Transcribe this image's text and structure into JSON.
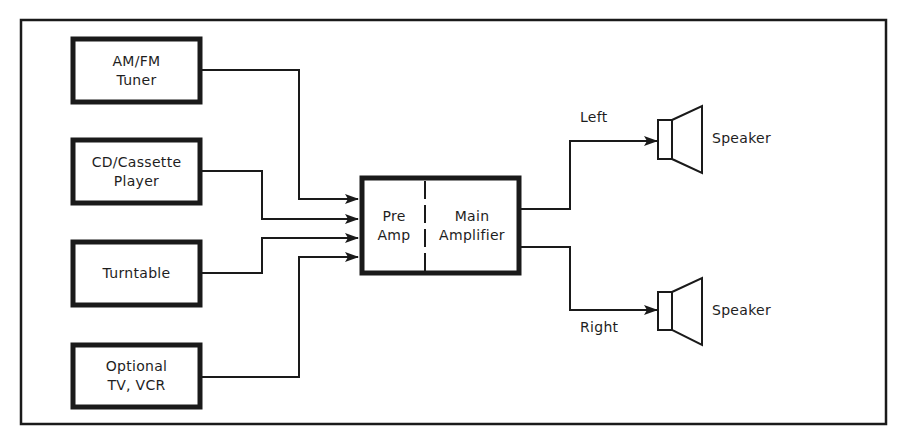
{
  "diagram": {
    "sources": [
      {
        "id": "am-fm-tuner",
        "line1": "AM/FM",
        "line2": "Tuner"
      },
      {
        "id": "cd-cassette-player",
        "line1": "CD/Cassette",
        "line2": "Player"
      },
      {
        "id": "turntable",
        "line1": "Turntable",
        "line2": ""
      },
      {
        "id": "optional-tv-vcr",
        "line1": "Optional",
        "line2": "TV, VCR"
      }
    ],
    "amplifier": {
      "pre_line1": "Pre",
      "pre_line2": "Amp",
      "main_line1": "Main",
      "main_line2": "Amplifier"
    },
    "outputs": [
      {
        "channel": "Left",
        "device": "Speaker"
      },
      {
        "channel": "Right",
        "device": "Speaker"
      }
    ],
    "colors": {
      "stroke": "#1a1a1a",
      "background": "#ffffff"
    }
  }
}
